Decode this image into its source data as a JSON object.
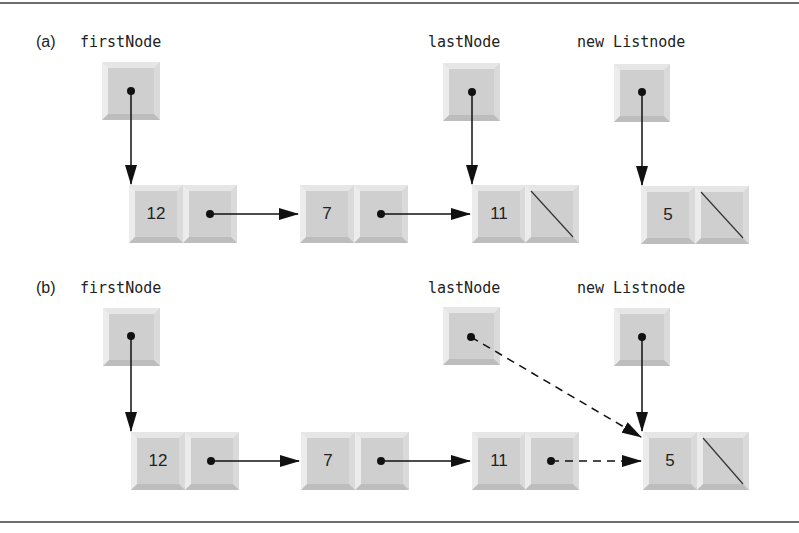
{
  "figure": {
    "parts": [
      {
        "label": "(a)",
        "pointers": [
          {
            "name": "firstNode",
            "label": "firstNode"
          },
          {
            "name": "lastNode",
            "label": "lastNode"
          },
          {
            "name": "newNode",
            "label": "new Listnode"
          }
        ],
        "nodes": [
          {
            "value": "12",
            "next": "pointer"
          },
          {
            "value": "7",
            "next": "pointer"
          },
          {
            "value": "11",
            "next": "null"
          },
          {
            "value": "5",
            "next": "null"
          }
        ]
      },
      {
        "label": "(b)",
        "pointers": [
          {
            "name": "firstNode",
            "label": "firstNode"
          },
          {
            "name": "lastNode",
            "label": "lastNode"
          },
          {
            "name": "newNode",
            "label": "new Listnode"
          }
        ],
        "nodes": [
          {
            "value": "12",
            "next": "pointer"
          },
          {
            "value": "7",
            "next": "pointer"
          },
          {
            "value": "11",
            "next": "pointer (dashed)"
          },
          {
            "value": "5",
            "next": "null"
          }
        ]
      }
    ],
    "colors": {
      "cell_face": "#d2d2d2",
      "line": "#111111",
      "frame": "#6e6e6e"
    }
  }
}
